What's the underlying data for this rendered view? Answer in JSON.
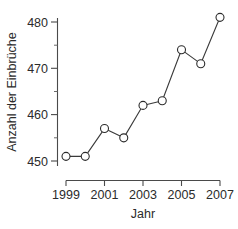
{
  "chart_data": {
    "type": "line",
    "title": "",
    "xlabel": "Jahr",
    "ylabel": "Anzahl der Einbrüche",
    "x": [
      1999,
      2000,
      2001,
      2002,
      2003,
      2004,
      2005,
      2006,
      2007
    ],
    "values": [
      451,
      451,
      457,
      455,
      462,
      463,
      474,
      471,
      481
    ],
    "categories": [
      "1999",
      "2000",
      "2001",
      "2002",
      "2003",
      "2004",
      "2005",
      "2006",
      "2007"
    ],
    "xlim": [
      1999,
      2007
    ],
    "ylim": [
      448,
      482
    ],
    "x_tick_labels": [
      "1999",
      "2001",
      "2003",
      "2005",
      "2007"
    ],
    "x_tick_values": [
      1999,
      2001,
      2003,
      2005,
      2007
    ],
    "y_tick_labels": [
      "450",
      "460",
      "470",
      "480"
    ],
    "y_tick_values": [
      450,
      460,
      470,
      480
    ],
    "y_minor_tick_values": [
      455,
      465,
      475
    ],
    "grid": false,
    "legend": false,
    "marker": "open-circle",
    "line_color": "#2b2b2b",
    "marker_fill": "#ffffff",
    "background": "#ffffff"
  },
  "axes": {
    "y_title": "Anzahl der Einbrüche",
    "x_title": "Jahr"
  }
}
